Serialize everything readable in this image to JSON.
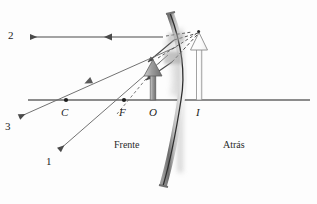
{
  "figure": {
    "background_color": "#fdfdfd",
    "axis_color": "#1d1d1d",
    "ray_color": "#555555",
    "mirror_color": "#7a7a7a",
    "object_arrow_color": "#a8a8a8",
    "image_arrow_color": "#ffffff"
  },
  "labels": {
    "ray1": "1",
    "ray2": "2",
    "ray3": "3",
    "center_of_curvature": "C",
    "focal_point": "F",
    "optical_center": "O",
    "image_point": "I",
    "front_side": "Frente",
    "back_side": "Atrás"
  },
  "geometry": {
    "axis": {
      "x1": 28,
      "y1": 100,
      "x2": 310,
      "y2": 100
    },
    "points": {
      "C": {
        "x": 66,
        "y": 100
      },
      "F": {
        "x": 124,
        "y": 100
      },
      "O": {
        "x": 153,
        "y": 100
      },
      "I": {
        "x": 199,
        "y": 100
      }
    },
    "object_arrow": {
      "x": 153,
      "base_y": 100,
      "tip_y": 60,
      "height": 40
    },
    "image_arrow": {
      "x": 199,
      "base_y": 100,
      "tip_y": 32,
      "height": 68
    },
    "mirror": {
      "top_x": 170,
      "top_y": 13,
      "vertex_x": 181,
      "vertex_y": 100,
      "bottom_x": 163,
      "bottom_y": 186
    },
    "ray2_y": 37,
    "ray2_arrow_tip_x": 28,
    "ray1_tip": {
      "x": 57,
      "y": 152
    },
    "ray3_tip": {
      "x": 17,
      "y": 118
    }
  },
  "label_positions": {
    "ray1": {
      "left": 46,
      "top": 156
    },
    "ray2": {
      "left": 8,
      "top": 30
    },
    "ray3": {
      "left": 5,
      "top": 120
    },
    "C": {
      "left": 61,
      "top": 107
    },
    "F": {
      "left": 119,
      "top": 107
    },
    "O": {
      "left": 149,
      "top": 107
    },
    "I": {
      "left": 196,
      "top": 107
    },
    "front_side": {
      "left": 114,
      "top": 140
    },
    "back_side": {
      "left": 223,
      "top": 140
    }
  }
}
